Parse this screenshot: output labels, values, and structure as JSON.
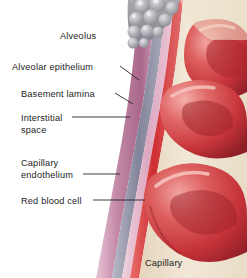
{
  "figure": {
    "background_color": "#ffffff"
  },
  "labels": [
    {
      "id": "alveolus",
      "text": "Alveolus",
      "x": 60,
      "y": 31,
      "leader": false
    },
    {
      "id": "alveolar-epithelium",
      "text": "Alveolar epithelium",
      "x": 12,
      "y": 62,
      "leader": true
    },
    {
      "id": "basement-lamina",
      "text": "Basement lamina",
      "x": 21,
      "y": 89,
      "leader": true
    },
    {
      "id": "interstitial-space",
      "text": "Interstitial\nspace",
      "x": 21,
      "y": 113,
      "leader": true
    },
    {
      "id": "capillary-endothelium",
      "text": "Capillary\nendothelium",
      "x": 21,
      "y": 158,
      "leader": true
    },
    {
      "id": "red-blood-cell",
      "text": "Red blood cell",
      "x": 21,
      "y": 196,
      "leader": true
    },
    {
      "id": "capillary",
      "text": "Capillary",
      "x": 145,
      "y": 258,
      "leader": false
    }
  ],
  "colors": {
    "alveolar_cells": "#9a9a9e",
    "alveolar_cells_light": "#c8c8cc",
    "epithelium": "#b9829f",
    "epithelium_light": "#d9a9c0",
    "basement_lamina": "#8e8fa3",
    "interstitial": "#e2b9cb",
    "endothelium": "#d8393a",
    "capillary_lumen": "#ece0cb",
    "rbc": "#c8373c",
    "rbc_light": "#e8888a",
    "rbc_dark": "#9e2328",
    "leader_line": "#1c1c1c",
    "text": "#1c1c1c"
  },
  "structures": [
    {
      "name": "alveolus-cell-cluster",
      "description": "grey rounded pneumocytes at top"
    },
    {
      "name": "alveolar-epithelium-layer",
      "description": "mauve band"
    },
    {
      "name": "basement-lamina-layer",
      "description": "grey-blue band"
    },
    {
      "name": "interstitial-space-layer",
      "description": "pink band"
    },
    {
      "name": "capillary-endothelium-layer",
      "description": "red band"
    },
    {
      "name": "capillary-lumen",
      "description": "cream interior"
    },
    {
      "name": "red-blood-cell-upper",
      "description": "biconcave red cell top right"
    },
    {
      "name": "red-blood-cell-middle",
      "description": "biconcave red cell middle"
    },
    {
      "name": "red-blood-cell-lower",
      "description": "biconcave red cell bottom"
    }
  ]
}
